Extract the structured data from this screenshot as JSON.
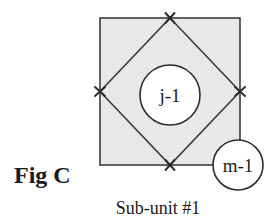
{
  "figure": {
    "fig_label": "Fig C",
    "caption": "Sub-unit #1",
    "nodes": {
      "inner_circle_label": "j-1",
      "corner_circle_label": "m-1"
    },
    "colors": {
      "square_fill": "#e8e8e8",
      "square_stroke": "#3c3c3c",
      "diamond_stroke": "#3c3c3c",
      "circle_fill": "#ffffff",
      "circle_stroke": "#2b2b2b",
      "marker_color": "#2b2b2b",
      "text_color": "#1a1a1a",
      "background": "#ffffff"
    },
    "geometry": {
      "square": {
        "x": 100,
        "y": 18,
        "width": 140,
        "height": 147
      },
      "diamond_vertices": [
        {
          "name": "top",
          "x": 170,
          "y": 18
        },
        {
          "name": "right",
          "x": 240,
          "y": 91.5
        },
        {
          "name": "bottom",
          "x": 170,
          "y": 165
        },
        {
          "name": "left",
          "x": 100,
          "y": 91.5
        }
      ],
      "inner_circle": {
        "cx": 170,
        "cy": 95,
        "r": 30
      },
      "corner_circle": {
        "cx": 238,
        "cy": 165,
        "r": 25
      }
    },
    "markers": [
      {
        "name": "vertex-marker-top",
        "x": 170,
        "y": 18,
        "rotation": 0
      },
      {
        "name": "vertex-marker-right",
        "x": 240,
        "y": 91.5,
        "rotation": 90
      },
      {
        "name": "vertex-marker-bottom",
        "x": 170,
        "y": 165,
        "rotation": 180
      },
      {
        "name": "vertex-marker-left",
        "x": 100,
        "y": 91.5,
        "rotation": 270
      }
    ]
  }
}
